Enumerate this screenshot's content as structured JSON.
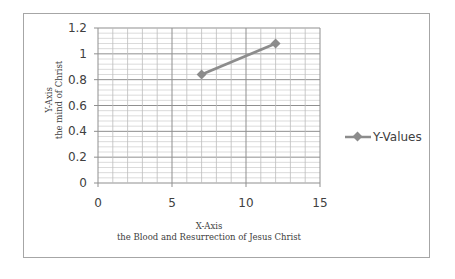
{
  "chart_data": {
    "type": "scatter",
    "title": "",
    "xlabel": "X-Axis",
    "xlabel_sub": "the Blood and Resurrection of Jesus Christ",
    "ylabel": "Y-Axis",
    "ylabel_sub": "the mind of Christ",
    "xlim": [
      0,
      15
    ],
    "ylim": [
      0,
      1.2
    ],
    "x_ticks": [
      "0",
      "5",
      "10",
      "15"
    ],
    "y_ticks": [
      "0",
      "0.2",
      "0.4",
      "0.6",
      "0.8",
      "1",
      "1.2"
    ],
    "grid": true,
    "legend_position": "right",
    "series": [
      {
        "name": "Y-Values",
        "x": [
          7,
          12
        ],
        "values": [
          0.84,
          1.08
        ],
        "color": "#8c8c8c",
        "marker": "diamond",
        "line": true
      }
    ]
  },
  "legend": {
    "label": "Y-Values"
  }
}
